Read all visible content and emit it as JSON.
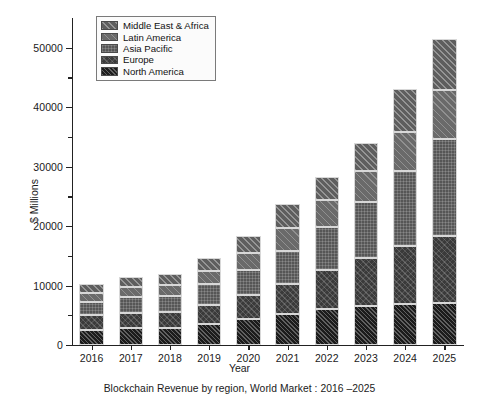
{
  "chart_data": {
    "type": "bar",
    "stacked": true,
    "title": "",
    "caption": "Blockchain Revenue by region, World Market : 2016 –2025",
    "xlabel": "Year",
    "ylabel": "$ Millions",
    "categories": [
      "2016",
      "2017",
      "2018",
      "2019",
      "2020",
      "2021",
      "2022",
      "2023",
      "2024",
      "2025"
    ],
    "ylim": [
      0,
      55000
    ],
    "yticks": [
      0,
      10000,
      20000,
      30000,
      40000,
      50000
    ],
    "ytick_labels": [
      "0",
      "10000",
      "20000",
      "30000",
      "40000",
      "50000"
    ],
    "yminor_ticks": [
      5000,
      15000,
      25000,
      35000,
      45000
    ],
    "grid": false,
    "legend_position": "upper left",
    "series": [
      {
        "name": "North America",
        "pattern": "dense-diagonal-dark",
        "color": "#1c1c1c",
        "values": [
          2600,
          2800,
          2900,
          3500,
          4300,
          5200,
          6100,
          6600,
          6900,
          7100
        ]
      },
      {
        "name": "Europe",
        "pattern": "cross-hatch-dark",
        "color": "#3a3a3a",
        "values": [
          2400,
          2600,
          2700,
          3300,
          4100,
          5000,
          6500,
          8000,
          9700,
          11300
        ]
      },
      {
        "name": "Asia Pacific",
        "pattern": "fine-checker-mid",
        "color": "#565656",
        "values": [
          2300,
          2600,
          2700,
          3400,
          4300,
          5600,
          7300,
          9400,
          12600,
          16200
        ]
      },
      {
        "name": "Latin America",
        "pattern": "wide-diagonal-light",
        "color": "#6a6a6a",
        "values": [
          1500,
          1700,
          1800,
          2200,
          2800,
          3800,
          4500,
          5200,
          6600,
          8300
        ]
      },
      {
        "name": "Middle East & Africa",
        "pattern": "diagonal-light",
        "color": "#5e5e5e",
        "values": [
          1400,
          1700,
          1800,
          2200,
          2800,
          4100,
          3900,
          4800,
          7200,
          8600
        ]
      }
    ],
    "totals": [
      10200,
      11400,
      11900,
      14600,
      18300,
      23700,
      28300,
      34000,
      43000,
      51500
    ],
    "legend_entries": [
      "Middle East & Africa",
      "Latin America",
      "Asia Pacific",
      "Europe",
      "North America"
    ]
  }
}
